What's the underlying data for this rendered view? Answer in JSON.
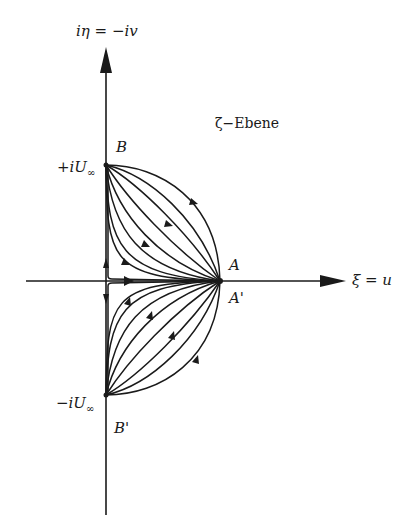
{
  "diagram": {
    "plane_label": "ζ−Ebene",
    "axes": {
      "vertical": {
        "label": "iη = −iv"
      },
      "horizontal": {
        "label": "ξ = u"
      }
    },
    "points": {
      "B": {
        "label": "B",
        "value_label": "+iU",
        "value_sub": "∞"
      },
      "B_prime": {
        "label": "B'",
        "value_label": "−iU",
        "value_sub": "∞"
      },
      "A": {
        "label": "A"
      },
      "A_prime": {
        "label": "A'"
      }
    },
    "colors": {
      "ink": "#1a1a1a",
      "background": "#ffffff"
    },
    "streamlines": {
      "upper_count": 9,
      "lower_count": 9,
      "direction_upper": "from B to A",
      "direction_lower": "from A to B'"
    }
  }
}
